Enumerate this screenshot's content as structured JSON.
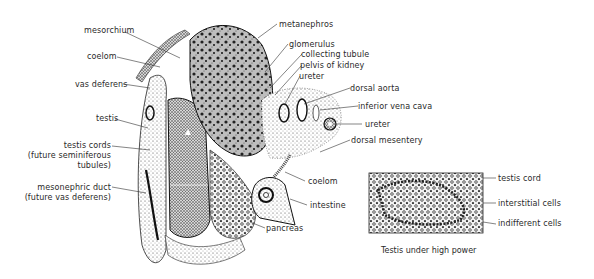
{
  "figure": {
    "main_section": {
      "labels": {
        "mesorchium": "mesorchium",
        "coelom_upper": "coelom",
        "vas_deferens": "vas deferens",
        "testis": "testis",
        "testis_cords_1": "testis cords",
        "testis_cords_2": "(future seminiferous",
        "testis_cords_3": "tubules)",
        "mesonephric_duct_1": "mesonephric duct",
        "mesonephric_duct_2": "(future vas deferens)",
        "metanephros": "metanephros",
        "glomerulus": "glomerulus",
        "collecting_tubule": "collecting tubule",
        "pelvis_of_kidney": "pelvis of kidney",
        "ureter_upper": "ureter",
        "dorsal_aorta": "dorsal aorta",
        "inferior_vena_cava": "inferior vena cava",
        "ureter_lower": "ureter",
        "dorsal_mesentery": "dorsal mesentery",
        "coelom_lower": "coelom",
        "intestine": "intestine",
        "pancreas": "pancreas"
      }
    },
    "inset": {
      "labels": {
        "testis_cord": "testis cord",
        "interstitial_cells": "interstitial cells",
        "indifferent_cells": "indifferent cells"
      },
      "caption": "Testis under high power"
    },
    "colors": {
      "ink": "#1a1a1a",
      "stipple": "#555555",
      "background": "#ffffff"
    }
  }
}
